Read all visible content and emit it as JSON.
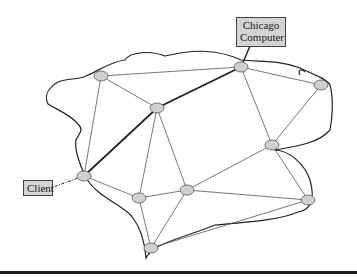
{
  "diagram": {
    "labels": {
      "chicago": [
        "Chicago",
        "Computer"
      ],
      "client": "Client"
    },
    "colors": {
      "node_fill": "#d0d0d0",
      "node_stroke": "#555555",
      "edge": "#555555",
      "route": "#222222",
      "boundary": "#222222",
      "label_bg": "#d3d3d3"
    },
    "nodes": [
      {
        "id": "n1",
        "x": 101,
        "y": 76
      },
      {
        "id": "n2",
        "x": 241,
        "y": 67
      },
      {
        "id": "n3",
        "x": 321,
        "y": 85
      },
      {
        "id": "n4",
        "x": 157,
        "y": 108
      },
      {
        "id": "n5",
        "x": 272,
        "y": 145
      },
      {
        "id": "n6",
        "x": 84,
        "y": 176
      },
      {
        "id": "n7",
        "x": 139,
        "y": 198
      },
      {
        "id": "n8",
        "x": 187,
        "y": 190
      },
      {
        "id": "n9",
        "x": 308,
        "y": 200
      },
      {
        "id": "n10",
        "x": 151,
        "y": 248
      }
    ],
    "edges": [
      [
        "n1",
        "n2"
      ],
      [
        "n1",
        "n4"
      ],
      [
        "n1",
        "n6"
      ],
      [
        "n2",
        "n3"
      ],
      [
        "n2",
        "n5"
      ],
      [
        "n3",
        "n5"
      ],
      [
        "n4",
        "n7"
      ],
      [
        "n4",
        "n8"
      ],
      [
        "n5",
        "n8"
      ],
      [
        "n5",
        "n9"
      ],
      [
        "n6",
        "n7"
      ],
      [
        "n7",
        "n8"
      ],
      [
        "n7",
        "n10"
      ],
      [
        "n8",
        "n9"
      ],
      [
        "n8",
        "n10"
      ],
      [
        "n9",
        "n10"
      ]
    ],
    "route": [
      "n6",
      "n4",
      "n2"
    ]
  }
}
